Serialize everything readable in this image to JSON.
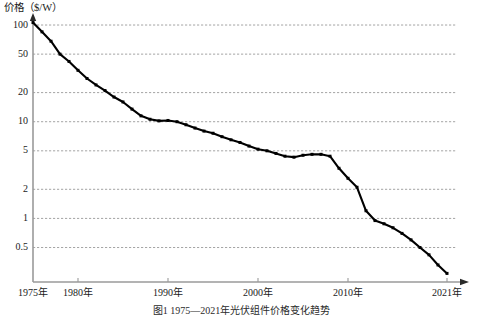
{
  "chart_data": {
    "type": "line",
    "title": "",
    "caption": "图1 1975—2021年光伏组件价格变化趋势",
    "ylabel": "价格（$/W）",
    "xlabel": "",
    "yscale": "log",
    "ylim": [
      0.22,
      130
    ],
    "xlim": [
      1975,
      2022
    ],
    "grid": true,
    "legend": null,
    "yticks": [
      {
        "value": 100,
        "label": "100"
      },
      {
        "value": 50,
        "label": "50"
      },
      {
        "value": 20,
        "label": "20"
      },
      {
        "value": 10,
        "label": "10"
      },
      {
        "value": 5,
        "label": "5"
      },
      {
        "value": 2,
        "label": "2"
      },
      {
        "value": 1,
        "label": "1"
      },
      {
        "value": 0.5,
        "label": "0.5"
      }
    ],
    "xticks": [
      {
        "value": 1975,
        "label": "1975年"
      },
      {
        "value": 1980,
        "label": "1980年"
      },
      {
        "value": 1990,
        "label": "1990年"
      },
      {
        "value": 2000,
        "label": "2000年"
      },
      {
        "value": 2010,
        "label": "2010年"
      },
      {
        "value": 2021,
        "label": "2021年"
      }
    ],
    "series": [
      {
        "name": "光伏组件价格",
        "color": "#000000",
        "x": [
          1975,
          1976,
          1977,
          1978,
          1979,
          1980,
          1981,
          1982,
          1983,
          1984,
          1985,
          1986,
          1987,
          1988,
          1989,
          1990,
          1991,
          1992,
          1993,
          1994,
          1995,
          1996,
          1997,
          1998,
          1999,
          2000,
          2001,
          2002,
          2003,
          2004,
          2005,
          2006,
          2007,
          2008,
          2009,
          2010,
          2011,
          2012,
          2013,
          2014,
          2015,
          2016,
          2017,
          2018,
          2019,
          2020,
          2021
        ],
        "values": [
          106,
          85,
          68,
          50,
          42,
          34,
          28,
          24,
          21,
          18,
          16,
          13.5,
          11.5,
          10.6,
          10.2,
          10.3,
          10.0,
          9.3,
          8.6,
          8.0,
          7.6,
          7.0,
          6.5,
          6.1,
          5.6,
          5.2,
          5.0,
          4.7,
          4.4,
          4.3,
          4.5,
          4.6,
          4.6,
          4.4,
          3.3,
          2.6,
          2.1,
          1.2,
          0.95,
          0.88,
          0.8,
          0.7,
          0.6,
          0.5,
          0.42,
          0.33,
          0.27
        ]
      }
    ]
  },
  "geometry": {
    "plot_left": 33,
    "plot_right": 468,
    "plot_top": 14,
    "plot_bottom": 282,
    "grid_right": 456
  }
}
